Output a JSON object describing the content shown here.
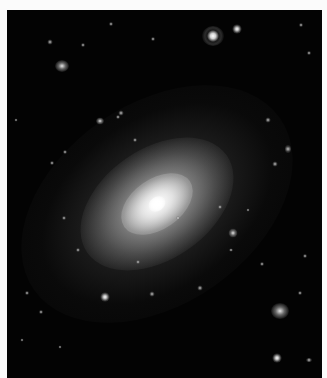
{
  "image": {
    "subject": "elliptical galaxy in deep field",
    "background_color": "#030303",
    "border_color": "#fbfbfb",
    "frame": {
      "left": 7,
      "top": 10,
      "width": 315,
      "height": 368
    }
  },
  "galaxy": {
    "center_x": 150,
    "center_y": 194,
    "rotation_deg": -35,
    "halo_outer": {
      "w": 300,
      "h": 200
    },
    "halo_mid": {
      "w": 170,
      "h": 110
    },
    "halo_inner": {
      "w": 80,
      "h": 50
    },
    "core": {
      "w": 18,
      "h": 14
    }
  },
  "objects": [
    {
      "type": "galaxy",
      "x": 62,
      "y": 66,
      "w": 14,
      "h": 12
    },
    {
      "type": "spiral",
      "x": 213,
      "y": 36,
      "w": 22,
      "h": 20
    },
    {
      "type": "star",
      "x": 237,
      "y": 29,
      "w": 9,
      "h": 9
    },
    {
      "type": "galaxy",
      "x": 280,
      "y": 311,
      "w": 18,
      "h": 16
    },
    {
      "type": "star",
      "x": 277,
      "y": 358,
      "w": 9,
      "h": 9
    },
    {
      "type": "star",
      "x": 105,
      "y": 297,
      "w": 9,
      "h": 9
    },
    {
      "type": "speck",
      "x": 152,
      "y": 294,
      "w": 5,
      "h": 5
    },
    {
      "type": "galaxy",
      "x": 233,
      "y": 233,
      "w": 9,
      "h": 9
    },
    {
      "type": "speck",
      "x": 121,
      "y": 113,
      "w": 5,
      "h": 5
    },
    {
      "type": "speck",
      "x": 118,
      "y": 117,
      "w": 4,
      "h": 4
    },
    {
      "type": "galaxy",
      "x": 100,
      "y": 121,
      "w": 8,
      "h": 7
    },
    {
      "type": "speck",
      "x": 50,
      "y": 42,
      "w": 5,
      "h": 5
    },
    {
      "type": "speck",
      "x": 111,
      "y": 24,
      "w": 4,
      "h": 4
    },
    {
      "type": "speck",
      "x": 83,
      "y": 45,
      "w": 4,
      "h": 4
    },
    {
      "type": "speck",
      "x": 153,
      "y": 39,
      "w": 4,
      "h": 4
    },
    {
      "type": "speck",
      "x": 268,
      "y": 120,
      "w": 5,
      "h": 5
    },
    {
      "type": "speck",
      "x": 288,
      "y": 149,
      "w": 6,
      "h": 8
    },
    {
      "type": "speck",
      "x": 275,
      "y": 164,
      "w": 5,
      "h": 5
    },
    {
      "type": "speck",
      "x": 301,
      "y": 25,
      "w": 4,
      "h": 4
    },
    {
      "type": "speck",
      "x": 309,
      "y": 53,
      "w": 4,
      "h": 4
    },
    {
      "type": "speck",
      "x": 65,
      "y": 152,
      "w": 4,
      "h": 4
    },
    {
      "type": "speck",
      "x": 52,
      "y": 163,
      "w": 4,
      "h": 4
    },
    {
      "type": "speck",
      "x": 135,
      "y": 140,
      "w": 4,
      "h": 4
    },
    {
      "type": "speck",
      "x": 64,
      "y": 218,
      "w": 4,
      "h": 4
    },
    {
      "type": "speck",
      "x": 78,
      "y": 250,
      "w": 4,
      "h": 4
    },
    {
      "type": "speck",
      "x": 138,
      "y": 262,
      "w": 4,
      "h": 4
    },
    {
      "type": "speck",
      "x": 27,
      "y": 293,
      "w": 4,
      "h": 4
    },
    {
      "type": "speck",
      "x": 41,
      "y": 312,
      "w": 4,
      "h": 4
    },
    {
      "type": "speck",
      "x": 60,
      "y": 347,
      "w": 3,
      "h": 3
    },
    {
      "type": "speck",
      "x": 231,
      "y": 250,
      "w": 4,
      "h": 3
    },
    {
      "type": "speck",
      "x": 262,
      "y": 264,
      "w": 4,
      "h": 4
    },
    {
      "type": "speck",
      "x": 300,
      "y": 293,
      "w": 4,
      "h": 4
    },
    {
      "type": "speck",
      "x": 305,
      "y": 256,
      "w": 4,
      "h": 4
    },
    {
      "type": "speck",
      "x": 309,
      "y": 360,
      "w": 6,
      "h": 4
    },
    {
      "type": "speck",
      "x": 220,
      "y": 207,
      "w": 4,
      "h": 4
    },
    {
      "type": "speck",
      "x": 200,
      "y": 288,
      "w": 5,
      "h": 5
    },
    {
      "type": "speck",
      "x": 248,
      "y": 210,
      "w": 3,
      "h": 3
    },
    {
      "type": "speck",
      "x": 178,
      "y": 218,
      "w": 4,
      "h": 4
    },
    {
      "type": "speck",
      "x": 16,
      "y": 120,
      "w": 3,
      "h": 3
    },
    {
      "type": "speck",
      "x": 22,
      "y": 340,
      "w": 3,
      "h": 3
    }
  ]
}
